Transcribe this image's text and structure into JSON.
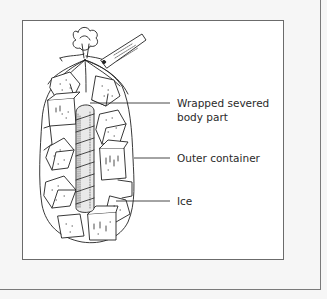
{
  "figure": {
    "labels": [
      {
        "id": "wrapped",
        "lines": [
          "Wrapped severed",
          "body part"
        ]
      },
      {
        "id": "outer",
        "lines": [
          "Outer container"
        ]
      },
      {
        "id": "ice",
        "lines": [
          "Ice"
        ]
      }
    ]
  },
  "colors": {
    "page_background": "#f6f6f6",
    "figure_background": "#ffffff",
    "border": "#6b6b6b",
    "line_art": "#222222"
  }
}
